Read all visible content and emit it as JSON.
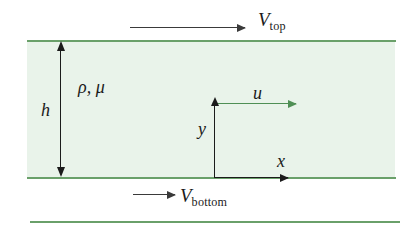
{
  "figure": {
    "colors": {
      "plate_line": "#6aa06a",
      "fluid_fill": "#e9f3ea",
      "arrow_dark": "#3a3a3a",
      "arrow_black": "#1b1b1b",
      "velocity_arrow": "#4f8f55",
      "background": "#ffffff"
    }
  },
  "labels": {
    "v_top": {
      "symbol": "V",
      "subscript": "top"
    },
    "v_bottom": {
      "symbol": "V",
      "subscript": "bottom"
    },
    "height": "h",
    "fluid_properties": "ρ, μ",
    "velocity_profile": "u",
    "axis_y": "y",
    "axis_x": "x"
  },
  "diagram_data": {
    "type": "schematic",
    "description": "Plane Couette flow: viscous fluid of density rho and dynamic viscosity mu confined in a gap of height h between a moving top plate and a moving bottom plate.",
    "elements": [
      {
        "name": "top-plate",
        "kind": "boundary-line",
        "orientation": "horizontal"
      },
      {
        "name": "bottom-plate",
        "kind": "boundary-line",
        "orientation": "horizontal"
      },
      {
        "name": "outer-reference-line",
        "kind": "boundary-line",
        "orientation": "horizontal"
      },
      {
        "name": "fluid-region",
        "kind": "filled-region"
      },
      {
        "name": "top-plate-velocity-arrow",
        "kind": "arrow",
        "direction": "right",
        "label": "V_top"
      },
      {
        "name": "bottom-plate-velocity-arrow",
        "kind": "arrow",
        "direction": "right",
        "label": "V_bottom"
      },
      {
        "name": "gap-height-dimension",
        "kind": "double-arrow",
        "direction": "vertical",
        "label": "h"
      },
      {
        "name": "flow-velocity-arrow",
        "kind": "arrow",
        "direction": "right",
        "label": "u"
      },
      {
        "name": "y-axis-arrow",
        "kind": "arrow",
        "direction": "up",
        "label": "y"
      },
      {
        "name": "x-axis-arrow",
        "kind": "arrow",
        "direction": "right",
        "label": "x"
      }
    ]
  }
}
